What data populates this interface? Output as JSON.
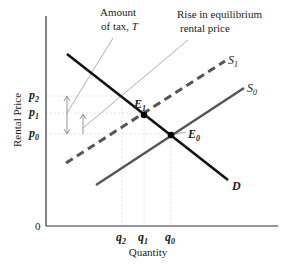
{
  "diagram": {
    "type": "supply-demand-tax",
    "axes": {
      "y_label": "Rental Price",
      "x_label": "Quantity",
      "origin_label": "0"
    },
    "price_ticks": [
      {
        "label": "p",
        "sub": "2",
        "y": 96
      },
      {
        "label": "p",
        "sub": "1",
        "y": 113
      },
      {
        "label": "p",
        "sub": "0",
        "y": 134
      }
    ],
    "quantity_ticks": [
      {
        "label": "q",
        "sub": "2",
        "x": 122
      },
      {
        "label": "q",
        "sub": "1",
        "x": 143
      },
      {
        "label": "q",
        "sub": "0",
        "x": 170
      }
    ],
    "curves": {
      "demand": {
        "label": "D",
        "color": "#111111",
        "style": "solid"
      },
      "supply_before": {
        "label": "S",
        "sub": "0",
        "color": "#555555",
        "style": "solid"
      },
      "supply_after": {
        "label": "S",
        "sub": "1",
        "color": "#555555",
        "style": "dashed"
      }
    },
    "equilibria": [
      {
        "label": "E",
        "sub": "1"
      },
      {
        "label": "E",
        "sub": "0"
      }
    ],
    "annotations": {
      "tax": {
        "line1": "Amount",
        "line2_prefix": "of tax, ",
        "line2_symbol": "T"
      },
      "rise": {
        "line1": "Rise in equilibrium",
        "line2": "rental price"
      }
    },
    "colors": {
      "axis": "#333333",
      "guide": "#dddddd",
      "annotation_line": "#999999"
    }
  }
}
